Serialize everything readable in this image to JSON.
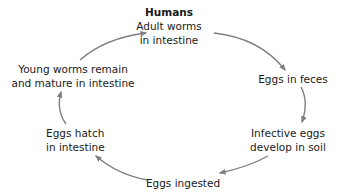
{
  "diagram": {
    "type": "life-cycle",
    "arrow_color": "#7f7f7f",
    "nodes": [
      {
        "id": "humans",
        "title": "Humans",
        "lines": [
          "Adult worms",
          "in intestine"
        ]
      },
      {
        "id": "feces",
        "lines": [
          "Eggs in feces"
        ]
      },
      {
        "id": "soil",
        "lines": [
          "Infective eggs",
          "develop in soil"
        ]
      },
      {
        "id": "ingested",
        "lines": [
          "Eggs ingested"
        ]
      },
      {
        "id": "hatch",
        "lines": [
          "Eggs hatch",
          "in intestine"
        ]
      },
      {
        "id": "mature",
        "lines": [
          "Young worms remain",
          "and mature in intestine"
        ]
      }
    ],
    "edges": [
      {
        "from": "humans",
        "to": "feces"
      },
      {
        "from": "feces",
        "to": "soil"
      },
      {
        "from": "soil",
        "to": "ingested"
      },
      {
        "from": "ingested",
        "to": "hatch"
      },
      {
        "from": "hatch",
        "to": "mature"
      },
      {
        "from": "mature",
        "to": "humans"
      }
    ]
  }
}
